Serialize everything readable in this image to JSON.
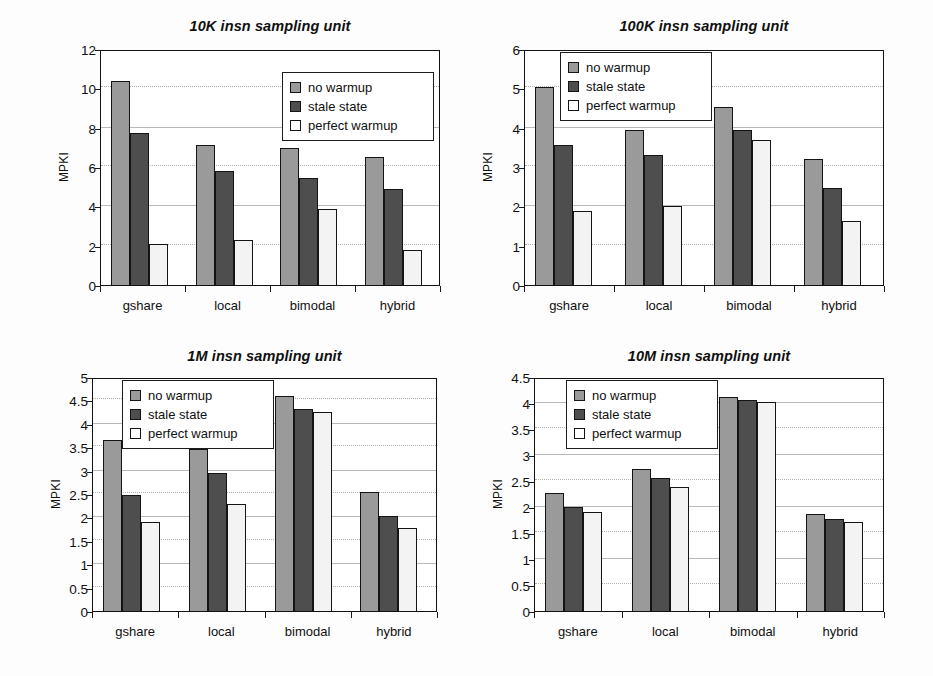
{
  "figure": {
    "background_color": "#fdfdfd",
    "series_colors": [
      "#9a9a9a",
      "#4e4e4e",
      "#f3f3f3"
    ]
  },
  "chart_data": [
    {
      "type": "bar",
      "title": "10K insn sampling unit",
      "xlabel": "",
      "ylabel": "MPKI",
      "categories": [
        "gshare",
        "local",
        "bimodal",
        "hybrid"
      ],
      "ylim": [
        0,
        12
      ],
      "yticks": [
        0,
        2,
        4,
        6,
        8,
        10,
        12
      ],
      "ytick_labels": [
        "0",
        "2",
        "4",
        "6",
        "8",
        "10",
        "12"
      ],
      "grid": true,
      "legend_position": "upper right",
      "series": [
        {
          "name": "no warmup",
          "values": [
            10.35,
            7.1,
            6.95,
            6.5
          ]
        },
        {
          "name": "stale state",
          "values": [
            7.75,
            5.8,
            5.45,
            4.9
          ]
        },
        {
          "name": "perfect warmup",
          "values": [
            2.1,
            2.3,
            3.85,
            1.8
          ]
        }
      ]
    },
    {
      "type": "bar",
      "title": "100K insn sampling unit",
      "xlabel": "",
      "ylabel": "MPKI",
      "categories": [
        "gshare",
        "local",
        "bimodal",
        "hybrid"
      ],
      "ylim": [
        0,
        6
      ],
      "yticks": [
        0,
        1,
        2,
        3,
        4,
        5,
        6
      ],
      "ytick_labels": [
        "0",
        "1",
        "2",
        "3",
        "4",
        "5",
        "6"
      ],
      "grid": true,
      "legend_position": "upper left",
      "series": [
        {
          "name": "no warmup",
          "values": [
            5.03,
            3.93,
            4.53,
            3.21
          ]
        },
        {
          "name": "stale state",
          "values": [
            3.55,
            3.31,
            3.95,
            2.46
          ]
        },
        {
          "name": "perfect warmup",
          "values": [
            1.87,
            2.02,
            3.68,
            1.63
          ]
        }
      ]
    },
    {
      "type": "bar",
      "title": "1M insn sampling unit",
      "xlabel": "",
      "ylabel": "MPKI",
      "categories": [
        "gshare",
        "local",
        "bimodal",
        "hybrid"
      ],
      "ylim": [
        0,
        5
      ],
      "yticks": [
        0,
        0.5,
        1,
        1.5,
        2,
        2.5,
        3,
        3.5,
        4,
        4.5,
        5
      ],
      "ytick_labels": [
        "0",
        "0.5",
        "1",
        "1.5",
        "2",
        "2.5",
        "3",
        "3.5",
        "4",
        "4.5",
        "5"
      ],
      "grid": true,
      "legend_position": "upper left",
      "series": [
        {
          "name": "no warmup",
          "values": [
            3.65,
            3.47,
            4.6,
            2.55
          ]
        },
        {
          "name": "stale state",
          "values": [
            2.48,
            2.95,
            4.32,
            2.03
          ]
        },
        {
          "name": "perfect warmup",
          "values": [
            1.9,
            2.28,
            4.25,
            1.77
          ]
        }
      ]
    },
    {
      "type": "bar",
      "title": "10M insn sampling unit",
      "xlabel": "",
      "ylabel": "MPKI",
      "categories": [
        "gshare",
        "local",
        "bimodal",
        "hybrid"
      ],
      "ylim": [
        0,
        4.5
      ],
      "yticks": [
        0,
        0.5,
        1,
        1.5,
        2,
        2.5,
        3,
        3.5,
        4,
        4.5
      ],
      "ytick_labels": [
        "0",
        "0.5",
        "1",
        "1.5",
        "2",
        "2.5",
        "3",
        "3.5",
        "4",
        "4.5"
      ],
      "grid": true,
      "legend_position": "upper left",
      "series": [
        {
          "name": "no warmup",
          "values": [
            2.27,
            2.74,
            4.12,
            1.87
          ]
        },
        {
          "name": "stale state",
          "values": [
            2.0,
            2.56,
            4.05,
            1.76
          ]
        },
        {
          "name": "perfect warmup",
          "values": [
            1.9,
            2.38,
            4.02,
            1.71
          ]
        }
      ]
    }
  ]
}
